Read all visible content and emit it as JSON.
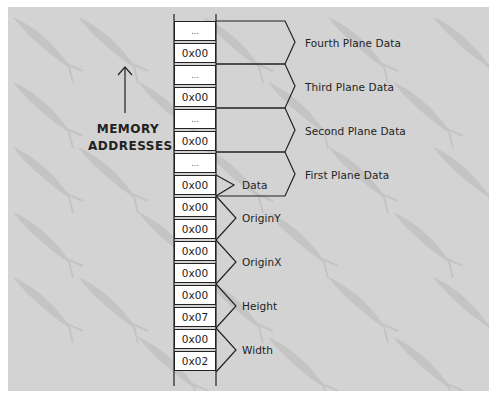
{
  "axis": {
    "arrow_label_line1": "MEMORY",
    "arrow_label_line2": "ADDRESSES"
  },
  "cells": [
    {
      "value": "...",
      "top": 21
    },
    {
      "value": "0x00",
      "top": 43
    },
    {
      "value": "...",
      "top": 65
    },
    {
      "value": "0x00",
      "top": 87
    },
    {
      "value": "...",
      "top": 109
    },
    {
      "value": "0x00",
      "top": 131
    },
    {
      "value": "...",
      "top": 153
    },
    {
      "value": "0x00",
      "top": 175
    },
    {
      "value": "0x00",
      "top": 197
    },
    {
      "value": "0x00",
      "top": 219
    },
    {
      "value": "0x00",
      "top": 241
    },
    {
      "value": "0x00",
      "top": 263
    },
    {
      "value": "0x00",
      "top": 285
    },
    {
      "value": "0x07",
      "top": 307
    },
    {
      "value": "0x00",
      "top": 329
    },
    {
      "value": "0x02",
      "top": 351
    }
  ],
  "fields": {
    "data": "Data",
    "origin_y": "OriginY",
    "origin_x": "OriginX",
    "height": "Height",
    "width": "Width"
  },
  "planes": {
    "fourth": "Fourth Plane Data",
    "third": "Third Plane Data",
    "second": "Second Plane Data",
    "first": "First Plane Data"
  },
  "colors": {
    "background": "#d3d3d3",
    "cell": "#ffffff",
    "line": "#222222",
    "watermark": "#c2c2c2"
  }
}
